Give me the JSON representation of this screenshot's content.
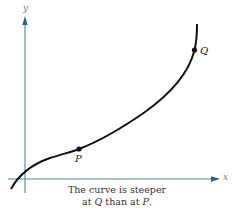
{
  "figure": {
    "axes": {
      "x_label": "x",
      "y_label": "y",
      "axis_color": "#4a86b8"
    },
    "curve": {
      "color": "#111111"
    },
    "points": {
      "P": {
        "label": "P"
      },
      "Q": {
        "label": "Q"
      }
    },
    "caption": {
      "line1": "The curve is steeper",
      "line2_prefix": "at ",
      "line2_q": "Q",
      "line2_mid": " than at ",
      "line2_p": "P",
      "line2_suffix": "."
    }
  }
}
